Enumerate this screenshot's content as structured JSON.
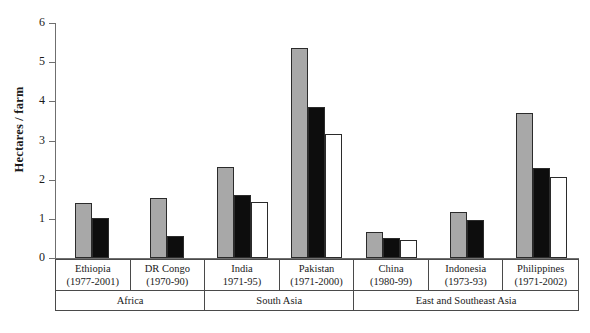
{
  "chart_data": {
    "type": "bar",
    "title": "",
    "xlabel": "",
    "ylabel": "Hectares / farm",
    "ylim": [
      0,
      6
    ],
    "yticks": [
      "0",
      "1",
      "2",
      "3",
      "4",
      "5",
      "6"
    ],
    "grid": false,
    "legend": "none",
    "categories": [
      "Ethiopia",
      "DR Congo",
      "India",
      "Pakistan",
      "China",
      "Indonesia",
      "Philippines"
    ],
    "category_periods": [
      "(1977-2001)",
      "(1970-90)",
      "1971-95)",
      "(1971-2000)",
      "(1980-99)",
      "(1973-93)",
      "(1971-2002)"
    ],
    "regions": [
      {
        "label": "Africa",
        "span": 2
      },
      {
        "label": "South Asia",
        "span": 2
      },
      {
        "label": "East and Southeast Asia",
        "span": 3
      }
    ],
    "series": [
      {
        "name": "first-period",
        "color": "#a8a8a8",
        "values": [
          1.4,
          1.52,
          2.33,
          5.37,
          0.67,
          1.18,
          3.7
        ]
      },
      {
        "name": "second-period",
        "color": "#0d0d0d",
        "values": [
          1.02,
          0.55,
          1.62,
          3.85,
          0.5,
          0.97,
          2.3
        ]
      },
      {
        "name": "third-period",
        "color": "#ffffff",
        "values": [
          null,
          null,
          1.43,
          3.17,
          0.47,
          null,
          2.08
        ]
      }
    ],
    "colors": {
      "series_gray": "#a8a8a8",
      "series_black": "#0d0d0d",
      "series_white": "#ffffff",
      "axis": "#6f6f6f",
      "outline": "#2b2b2b",
      "table_border": "#4a4a4a",
      "background": "#ffffff"
    }
  }
}
